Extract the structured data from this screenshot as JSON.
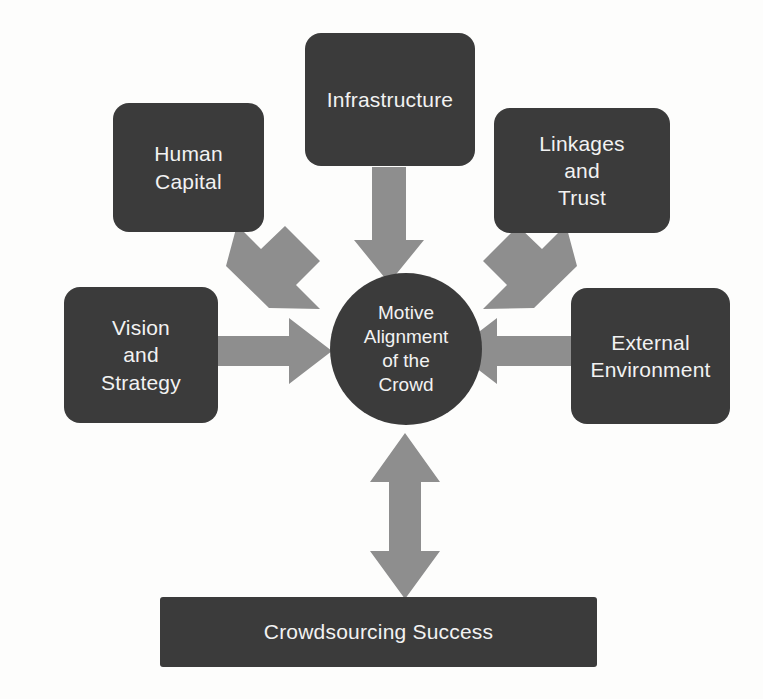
{
  "diagram": {
    "background_color": "#fdfdfc",
    "node_color": "#3b3b3b",
    "node_text_color": "#f2f2f2",
    "arrow_color": "#8e8e8e"
  },
  "nodes": {
    "infrastructure": {
      "label": "Infrastructure",
      "lines": [
        "Infrastructure"
      ]
    },
    "human_capital": {
      "label": "Human Capital",
      "lines": [
        "Human",
        "Capital"
      ]
    },
    "linkages_and_trust": {
      "label": "Linkages and Trust",
      "lines": [
        "Linkages",
        "and",
        "Trust"
      ]
    },
    "vision_and_strategy": {
      "label": "Vision and Strategy",
      "lines": [
        "Vision",
        "and",
        "Strategy"
      ]
    },
    "external_environment": {
      "label": "External Environment",
      "lines": [
        "External",
        "Environment"
      ]
    },
    "motive_alignment": {
      "label": "Motive Alignment of the Crowd",
      "lines": [
        "Motive",
        "Alignment",
        "of the",
        "Crowd"
      ]
    },
    "crowdsourcing_success": {
      "label": "Crowdsourcing Success",
      "lines": [
        "Crowdsourcing Success"
      ]
    }
  },
  "arrows": [
    {
      "id": "human-capital-to-center",
      "from": "human_capital",
      "to": "motive_alignment",
      "direction": "one-way",
      "orientation": "diagonal-down-right"
    },
    {
      "id": "infrastructure-to-center",
      "from": "infrastructure",
      "to": "motive_alignment",
      "direction": "one-way",
      "orientation": "down"
    },
    {
      "id": "linkages-trust-to-center",
      "from": "linkages_and_trust",
      "to": "motive_alignment",
      "direction": "one-way",
      "orientation": "diagonal-down-left"
    },
    {
      "id": "vision-strategy-to-center",
      "from": "vision_and_strategy",
      "to": "motive_alignment",
      "direction": "one-way",
      "orientation": "right"
    },
    {
      "id": "external-environment-to-center",
      "from": "external_environment",
      "to": "motive_alignment",
      "direction": "one-way",
      "orientation": "left"
    },
    {
      "id": "center-to-crowdsourcing-success",
      "from": "motive_alignment",
      "to": "crowdsourcing_success",
      "direction": "two-way",
      "orientation": "vertical"
    }
  ]
}
